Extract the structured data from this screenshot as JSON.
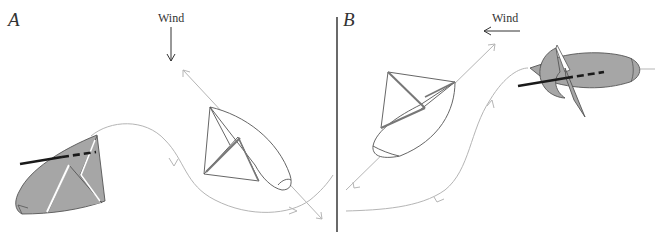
{
  "panels": [
    {
      "id": "A",
      "label": "A",
      "wind": {
        "label": "Wind",
        "direction": "down"
      },
      "boats": [
        {
          "name": "heeled-boat",
          "fill": "#a6a6a6",
          "state": "capsized-ish broad reach"
        },
        {
          "name": "upright-boat",
          "fill": "#ffffff",
          "state": "close-hauled"
        }
      ]
    },
    {
      "id": "B",
      "label": "B",
      "wind": {
        "label": "Wind",
        "direction": "left"
      },
      "boats": [
        {
          "name": "upright-boat",
          "fill": "#ffffff",
          "state": "reaching"
        },
        {
          "name": "heeled-boat",
          "fill": "#a6a6a6",
          "state": "heeled"
        }
      ]
    }
  ],
  "colors": {
    "path": "#b5b5b5",
    "outline": "#555555",
    "shaded": "#a6a6a6",
    "divider": "#444444",
    "boom": "#1a1a1a"
  }
}
